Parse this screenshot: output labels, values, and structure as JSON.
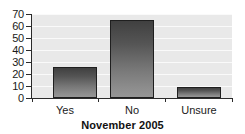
{
  "chart_data": {
    "type": "bar",
    "title": "",
    "subtitle": "",
    "xlabel": "November 2005",
    "ylabel": "",
    "categories": [
      "Yes",
      "No",
      "Unsure"
    ],
    "values": [
      26,
      65,
      9
    ],
    "series": [
      {
        "name": "Response",
        "values": [
          26,
          65,
          9
        ]
      }
    ],
    "ylim": [
      0,
      70
    ],
    "yticks": [
      0,
      10,
      20,
      30,
      40,
      50,
      60,
      70
    ],
    "ytick_labels": [
      "0",
      "10",
      "20",
      "30",
      "40",
      "50",
      "60",
      "70"
    ],
    "grid": true,
    "grid_axis": "y",
    "legend": false,
    "legend_position": "none",
    "orientation": "vertical",
    "annotations": []
  },
  "axes": {
    "y_tick_labels": [
      "70",
      "60",
      "50",
      "40",
      "30",
      "20",
      "10",
      "0"
    ],
    "x_tick_labels": [
      "Yes",
      "No",
      "Unsure"
    ],
    "x_title": "November 2005"
  },
  "colors": {
    "plot_background": "#e9e9e9",
    "gridline": "#fafafa",
    "axis_line": "#2b2b2b",
    "bar_top": "#404040",
    "bar_bottom": "#969696",
    "bar_border": "#1f1f1f",
    "text": "#1a1a1a",
    "page_background": "#ffffff"
  }
}
